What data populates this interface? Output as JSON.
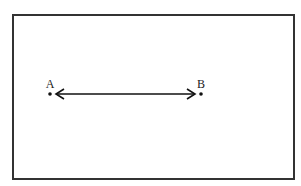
{
  "diagram": {
    "type": "line",
    "frame": {
      "x": 12,
      "y": 14,
      "width": 281,
      "height": 164,
      "stroke": "#333333"
    },
    "points": [
      {
        "id": "A",
        "label": "A",
        "x": 50,
        "y": 94
      },
      {
        "id": "B",
        "label": "B",
        "x": 201,
        "y": 94
      }
    ],
    "segment": {
      "from": "A",
      "to": "B",
      "arrowheads": "both",
      "stroke": "#111111"
    }
  }
}
